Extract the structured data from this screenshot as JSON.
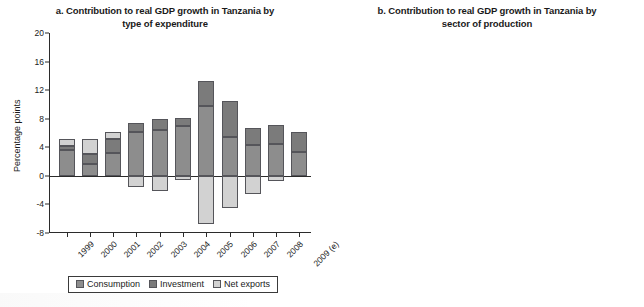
{
  "figure": {
    "background": "#ffffff",
    "scan_artifact": true
  },
  "panels": [
    {
      "id": "panel-a",
      "title_line1": "a. Contribution to real GDP growth in Tanzania by",
      "title_line2": "type of expenditure",
      "ylabel": "Percentage points",
      "yticks": [
        20,
        16,
        12,
        8,
        4,
        0,
        -4,
        -8
      ],
      "legend": [
        {
          "label": "Consumption",
          "color": "#8d8d8d"
        },
        {
          "label": "Investment",
          "color": "#7b7b7b"
        },
        {
          "label": "Net exports",
          "color": "#d2d2d2"
        }
      ]
    },
    {
      "id": "panel-b",
      "title_line1": "b. Contribution to real GDP growth in Tanzania by",
      "title_line2": "sector of production",
      "ylabel": "Percentage points",
      "yticks": [
        15,
        12,
        9,
        6,
        3,
        0
      ],
      "legend": [
        {
          "label": "Agriculture",
          "color": "#8d8d8d"
        },
        {
          "label": "Industry",
          "color": "#7b7b7b"
        },
        {
          "label": "Services",
          "color": "#d2d2d2"
        }
      ]
    }
  ],
  "chart_data": [
    {
      "type": "bar",
      "subtype": "stacked-bar-with-negatives",
      "title": "a. Contribution to real GDP growth in Tanzania by type of expenditure",
      "xlabel": "",
      "ylabel": "Percentage points",
      "ylim": [
        -8,
        20
      ],
      "ytick_step": 4,
      "grid": false,
      "legend_position": "bottom",
      "categories": [
        "1999",
        "2000",
        "2001",
        "2002",
        "2003",
        "2004",
        "2005",
        "2006",
        "2007",
        "2008",
        "2009 (e)"
      ],
      "series": [
        {
          "name": "Consumption",
          "color": "#8d8d8d",
          "values": [
            3.6,
            1.7,
            3.2,
            6.2,
            6.4,
            7.0,
            9.8,
            5.5,
            4.3,
            4.4,
            3.3
          ]
        },
        {
          "name": "Investment",
          "color": "#7b7b7b",
          "values": [
            0.6,
            1.3,
            1.9,
            1.2,
            1.6,
            1.1,
            3.5,
            5.0,
            2.4,
            2.7,
            2.8
          ]
        },
        {
          "name": "Net exports",
          "color": "#d2d2d2",
          "values": [
            1.0,
            2.1,
            1.0,
            -1.6,
            -2.1,
            -0.6,
            -6.7,
            -4.5,
            -2.5,
            -0.7,
            0.0
          ]
        }
      ]
    },
    {
      "type": "bar",
      "subtype": "stacked-bar",
      "title": "b. Contribution to real GDP growth in Tanzania by sector of production",
      "xlabel": "",
      "ylabel": "Percentage points",
      "ylim": [
        0,
        15
      ],
      "ytick_step": 3,
      "grid": false,
      "legend_position": "bottom",
      "categories": [
        "1999",
        "2000",
        "2001",
        "2002",
        "2003",
        "2004",
        "2005",
        "2006",
        "2007",
        "2008",
        "2009 (e)"
      ],
      "series": [
        {
          "name": "Agriculture",
          "color": "#8d8d8d",
          "values": [
            1.4,
            1.4,
            1.5,
            1.6,
            1.3,
            1.7,
            1.3,
            1.4,
            1.3,
            1.4,
            1.1
          ]
        },
        {
          "name": "Industry",
          "color": "#7b7b7b",
          "values": [
            1.1,
            0.8,
            1.2,
            1.5,
            1.7,
            2.6,
            2.0,
            1.5,
            1.6,
            1.6,
            1.4
          ]
        },
        {
          "name": "Services",
          "color": "#d2d2d2",
          "values": [
            2.4,
            2.7,
            3.3,
            3.9,
            3.4,
            3.1,
            3.9,
            3.7,
            4.0,
            4.2,
            3.3
          ]
        }
      ]
    }
  ]
}
